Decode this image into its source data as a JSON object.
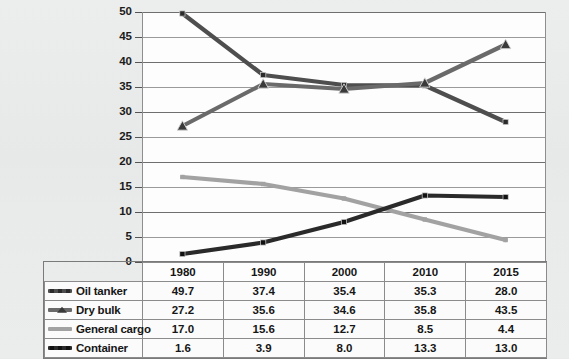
{
  "chart_data": {
    "type": "line",
    "title": "",
    "subtitle": "",
    "xlabel": "",
    "ylabel": "",
    "categories": [
      "1980",
      "1990",
      "2000",
      "2010",
      "2015"
    ],
    "ylim": [
      0,
      50
    ],
    "ytick_step": 5,
    "yticks": [
      "0",
      "5",
      "10",
      "15",
      "20",
      "25",
      "30",
      "35",
      "40",
      "45",
      "50"
    ],
    "grid": true,
    "legend_position": "table-left-column",
    "series": [
      {
        "name": "Oil tanker",
        "values": [
          49.7,
          37.4,
          35.4,
          35.3,
          28.0
        ],
        "color": "#4e4e4e",
        "marker": "square",
        "marker_color": "#2b2b2b"
      },
      {
        "name": "Dry bulk",
        "values": [
          27.2,
          35.6,
          34.6,
          35.8,
          43.5
        ],
        "color": "#6a6a6a",
        "marker": "triangle",
        "marker_color": "#3a3a3a"
      },
      {
        "name": "General cargo",
        "values": [
          17.0,
          15.6,
          12.7,
          8.5,
          4.4
        ],
        "color": "#a2a2a2",
        "marker": "none",
        "marker_color": "#a2a2a2"
      },
      {
        "name": "Container",
        "values": [
          1.6,
          3.9,
          8.0,
          13.3,
          13.0
        ],
        "color": "#2a2a2a",
        "marker": "square",
        "marker_color": "#111111"
      }
    ]
  },
  "table": {
    "corner_label": "",
    "column_headers": [
      "1980",
      "1990",
      "2000",
      "2010",
      "2015"
    ],
    "rows": [
      {
        "label": "Oil tanker",
        "values": [
          "49.7",
          "37.4",
          "35.4",
          "35.3",
          "28.0"
        ]
      },
      {
        "label": "Dry bulk",
        "values": [
          "27.2",
          "35.6",
          "34.6",
          "35.8",
          "43.5"
        ]
      },
      {
        "label": "General cargo",
        "values": [
          "17.0",
          "15.6",
          "12.7",
          "8.5",
          "4.4"
        ]
      },
      {
        "label": "Container",
        "values": [
          "1.6",
          "3.9",
          "8.0",
          "13.3",
          "13.0"
        ]
      }
    ]
  },
  "colors": {
    "background": "#e9eaea",
    "plot_background": "#fdfdfd",
    "gridline": "#6f6f6f",
    "table_border": "#8b8b8b",
    "text": "#161616"
  }
}
